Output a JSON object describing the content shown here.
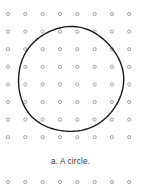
{
  "figure": {
    "type": "dot-grid-with-circle",
    "width": 141,
    "height": 193,
    "background_color": "#ffffff",
    "caption": "a. A circle.",
    "caption_color": "#3a3a3a",
    "caption_font_size_px": 8.2,
    "caption_top_px": 157
  },
  "dot_grid": {
    "description": "Array of small open circles (rings) arranged in a regular square lattice",
    "dot_color": "#8a8a8a",
    "dot_radius_px": 1.6,
    "dot_stroke_width_px": 0.8,
    "columns": 8,
    "rows_above_caption": 8,
    "rows_below_caption": 1,
    "column_x": [
      8,
      25.3,
      42.6,
      60,
      77.3,
      94.6,
      111.9,
      129.2
    ],
    "row_y_above_caption": [
      14,
      31.6,
      49.2,
      66.8,
      84.4,
      102,
      119.6,
      137.2
    ],
    "row_y_below_caption": [
      182
    ],
    "column_spacing_px": 17.3,
    "row_spacing_px": 17.6
  },
  "circle": {
    "label": "hand-drawn circle",
    "center_x": 70.5,
    "center_y": 79.5,
    "radius": 52.5,
    "stroke_color": "#1a1a1a",
    "stroke_width_px": 1.4,
    "fill": "none",
    "bounds": {
      "left": 18,
      "right": 123,
      "top": 27,
      "bottom": 132
    }
  }
}
